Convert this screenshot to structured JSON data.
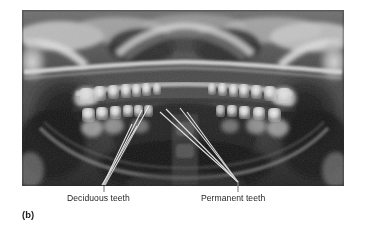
{
  "figure": {
    "panel_caption": "(b)",
    "image_type": "panoramic-dental-radiograph",
    "image_alt": "Panoramic dental radiograph (orthopantomogram) of a child's jaws showing both deciduous and developing permanent teeth",
    "background_color": "#ffffff",
    "frame": {
      "x": 22,
      "y": 10,
      "width": 322,
      "height": 176
    }
  },
  "annotations": [
    {
      "id": "deciduous",
      "label": "Deciduous teeth",
      "label_x": 67,
      "label_y": 193,
      "leader_color": "#f2f2f2",
      "tick_color": "#8a8a8a",
      "converge_x": 104,
      "converge_y": 186,
      "targets": [
        {
          "x": 120,
          "y": 100
        },
        {
          "x": 127,
          "y": 104
        },
        {
          "x": 110,
          "y": 122
        },
        {
          "x": 116,
          "y": 124
        }
      ]
    },
    {
      "id": "permanent",
      "label": "Permanent teeth",
      "label_x": 201,
      "label_y": 193,
      "leader_color": "#f2f2f2",
      "tick_color": "#8a8a8a",
      "converge_x": 238,
      "converge_y": 183,
      "targets": [
        {
          "x": 138,
          "y": 102
        },
        {
          "x": 144,
          "y": 100
        },
        {
          "x": 159,
          "y": 100
        },
        {
          "x": 165,
          "y": 103
        }
      ]
    }
  ],
  "radiograph_tones": {
    "film_base": "#4e4e4e",
    "soft_tissue_dark": "#2b2b2b",
    "air_space": "#1a1a1a",
    "bone_mid": "#8d8d8d",
    "bone_bright": "#d6d6d6",
    "enamel_highlight": "#ededed"
  }
}
